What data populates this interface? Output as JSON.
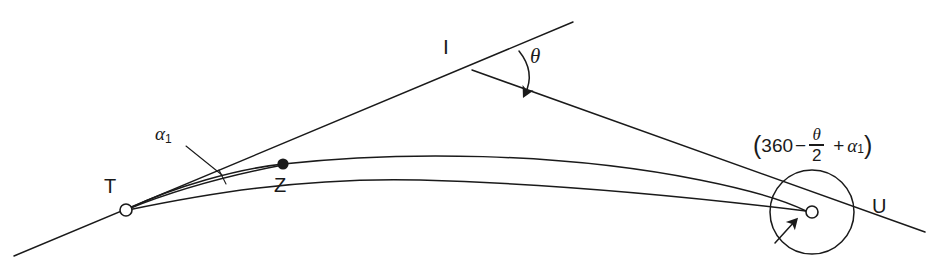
{
  "diagram": {
    "background_color": "#ffffff",
    "stroke_color": "#1a1a1a",
    "nodes": [
      {
        "id": "T",
        "label": "T",
        "marker": "open-circle",
        "x": 126,
        "y": 210
      },
      {
        "id": "Z",
        "label": "Z",
        "marker": "filled-dot",
        "x": 283,
        "y": 164
      },
      {
        "id": "I",
        "label": "I",
        "marker": "none",
        "x": 472,
        "y": 70
      },
      {
        "id": "U",
        "label": "U",
        "marker": "open-circle",
        "x": 812,
        "y": 212
      }
    ],
    "angles": {
      "theta": {
        "symbol": "θ",
        "at_node": "I",
        "arc_direction": "clockwise"
      },
      "alpha1": {
        "symbol": "α",
        "subscript": "1",
        "at_node": "T"
      }
    },
    "formula_u": {
      "open_paren": "(",
      "value": "360",
      "minus": "−",
      "fraction_numerator": "θ",
      "fraction_denominator": "2",
      "plus": "+",
      "alpha": "α",
      "alpha_subscript": "1",
      "close_paren": ")",
      "plain_text": "(360 − θ/2 + α₁)"
    }
  }
}
